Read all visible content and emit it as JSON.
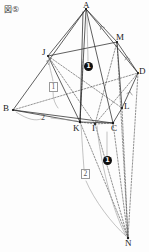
{
  "figure": {
    "tag": "図⑤",
    "title": "図⑤",
    "width": 149,
    "height": 252,
    "type": "solid-geometry-cross-section",
    "colors": {
      "stroke_solid": "#2b2b2b",
      "stroke_dashed": "#4a4a4a",
      "stroke_gray": "#8c8c8c",
      "marker_fill": "#101010",
      "marker_text": "#ffffff",
      "background": "#fdfdfd",
      "label_text": "#1a1a1a"
    }
  },
  "vertices": [
    {
      "name": "A",
      "label": "A",
      "x": 86,
      "y": 9,
      "lx": 83,
      "ly": 2
    },
    {
      "name": "M",
      "label": "M",
      "x": 117,
      "y": 42,
      "lx": 117,
      "ly": 35
    },
    {
      "name": "D",
      "label": "D",
      "x": 138,
      "y": 73,
      "lx": 139,
      "ly": 68
    },
    {
      "name": "J",
      "label": "J",
      "x": 48,
      "y": 56,
      "lx": 43,
      "ly": 49
    },
    {
      "name": "B",
      "label": "B",
      "x": 13,
      "y": 110,
      "lx": 4,
      "ly": 105
    },
    {
      "name": "L",
      "label": "L",
      "x": 122,
      "y": 108,
      "lx": 124,
      "ly": 104
    },
    {
      "name": "K",
      "label": "K",
      "x": 80,
      "y": 122,
      "lx": 74,
      "ly": 122
    },
    {
      "name": "I",
      "label": "I",
      "x": 95,
      "y": 124,
      "lx": 92,
      "ly": 122
    },
    {
      "name": "C",
      "label": "C",
      "x": 113,
      "y": 123,
      "lx": 112,
      "ly": 122
    },
    {
      "name": "N",
      "label": "N",
      "x": 128,
      "y": 238,
      "lx": 126,
      "ly": 238
    }
  ],
  "markers": [
    {
      "name": "circled-one-upper",
      "text": "1",
      "x": 88,
      "y": 66
    },
    {
      "name": "circled-one-lower",
      "text": "1",
      "x": 107,
      "y": 160
    }
  ],
  "boxed_labels": [
    {
      "name": "boxed-one",
      "text": "1",
      "x": 50,
      "y": 84
    },
    {
      "name": "boxed-two",
      "text": "2",
      "x": 84,
      "y": 172
    }
  ],
  "plain_labels": [
    {
      "name": "ratio-two",
      "text": "2",
      "x": 42,
      "y": 116
    }
  ],
  "edges": {
    "solid": [
      "A-B",
      "A-M",
      "A-D",
      "A-C",
      "A-K",
      "B-J",
      "J-M",
      "B-C",
      "B-K",
      "M-D",
      "D-L",
      "L-C",
      "K-C",
      "J-K",
      "M-L"
    ],
    "dashed": [
      "B-D",
      "J-I",
      "I-D",
      "I-C",
      "I-K",
      "M-I",
      "J-L",
      "K-N",
      "I-N",
      "C-N",
      "L-N",
      "D-N"
    ],
    "gray_guides": [
      "J-boxed1",
      "B-two-arrow",
      "K-boxed2",
      "N-arc"
    ]
  }
}
